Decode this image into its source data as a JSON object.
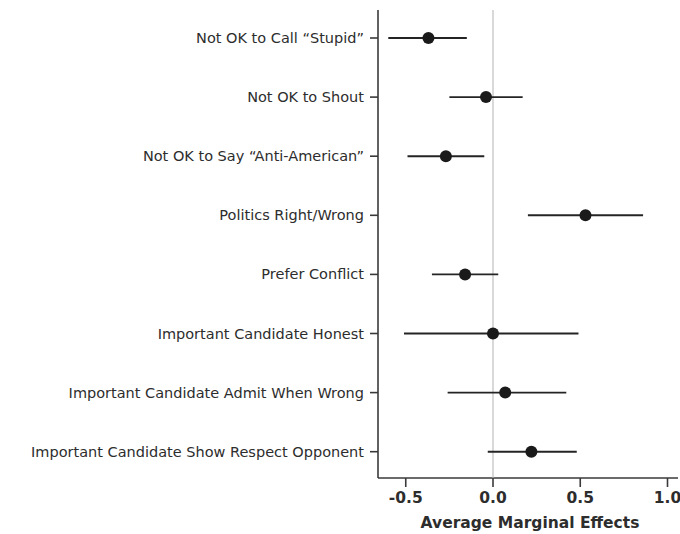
{
  "chart_data": {
    "type": "scatter",
    "title": "",
    "subtitle": "",
    "xlabel": "Average Marginal Effects",
    "ylabel": "",
    "xlim": [
      -0.68,
      1.12
    ],
    "xticks": [
      -0.5,
      0.0,
      0.5,
      1.0
    ],
    "xticklabels": [
      "-0.5",
      "0.0",
      "0.5",
      "1.0"
    ],
    "grid": false,
    "legend": null,
    "reference_line": {
      "x": 0.0,
      "color": "#b9b9b9",
      "style": "solid"
    },
    "orientation": "horizontal",
    "marker_color": "#1a1a1a",
    "errorbar_color": "#242424",
    "categories": [
      "Not OK to Call “Stupid”",
      "Not OK to Shout",
      "Not OK to Say “Anti-American”",
      "Politics Right/Wrong",
      "Prefer Conflict",
      "Important Candidate Honest",
      "Important Candidate Admit When Wrong",
      "Important Candidate Show Respect Opponent"
    ],
    "estimates": [
      -0.37,
      -0.04,
      -0.27,
      0.53,
      -0.16,
      0.0,
      0.07,
      0.22
    ],
    "ci_low": [
      -0.6,
      -0.25,
      -0.49,
      0.2,
      -0.35,
      -0.51,
      -0.26,
      -0.03
    ],
    "ci_high": [
      -0.15,
      0.17,
      -0.05,
      0.86,
      0.03,
      0.49,
      0.42,
      0.48
    ],
    "points": [
      {
        "label": "Not OK to Call “Stupid”",
        "estimate": -0.37,
        "ci_low": -0.6,
        "ci_high": -0.15
      },
      {
        "label": "Not OK to Shout",
        "estimate": -0.04,
        "ci_low": -0.25,
        "ci_high": 0.17
      },
      {
        "label": "Not OK to Say “Anti-American”",
        "estimate": -0.27,
        "ci_low": -0.49,
        "ci_high": -0.05
      },
      {
        "label": "Politics Right/Wrong",
        "estimate": 0.53,
        "ci_low": 0.2,
        "ci_high": 0.86
      },
      {
        "label": "Prefer Conflict",
        "estimate": -0.16,
        "ci_low": -0.35,
        "ci_high": 0.03
      },
      {
        "label": "Important Candidate Honest",
        "estimate": 0.0,
        "ci_low": -0.51,
        "ci_high": 0.49
      },
      {
        "label": "Important Candidate Admit When Wrong",
        "estimate": 0.07,
        "ci_low": -0.26,
        "ci_high": 0.42
      },
      {
        "label": "Important Candidate Show Respect Opponent",
        "estimate": 0.22,
        "ci_low": -0.03,
        "ci_high": 0.48
      }
    ]
  }
}
